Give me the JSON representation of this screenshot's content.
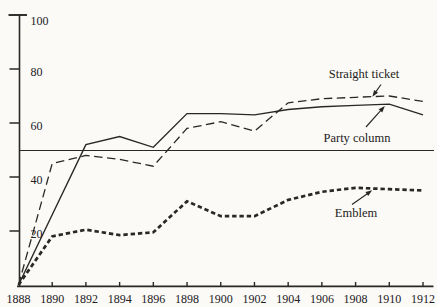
{
  "figure": {
    "background": "#fbfaf6",
    "ink": "#2a2825"
  },
  "chart_data": {
    "type": "line",
    "title": "",
    "xlabel": "",
    "ylabel": "",
    "x": [
      1888,
      1890,
      1892,
      1894,
      1896,
      1898,
      1900,
      1902,
      1904,
      1906,
      1908,
      1910,
      1912
    ],
    "x_tick_labels": [
      "1888",
      "1890",
      "1892",
      "1894",
      "1896",
      "1898",
      "1900",
      "1902",
      "1904",
      "1906",
      "1908",
      "1910",
      "1912"
    ],
    "ylim": [
      0,
      100
    ],
    "y_ticks": [
      20,
      40,
      60,
      80,
      100
    ],
    "grid": false,
    "legend": "inline-arrow-annotations",
    "reference_line": 50,
    "series": [
      {
        "name": "Straight ticket",
        "style": "long-dash",
        "dash": "8.5 4.5",
        "stroke_width": 1.3,
        "values": [
          0,
          45,
          48,
          46.5,
          44,
          58,
          60.5,
          57,
          67.5,
          69,
          69.5,
          70,
          68
        ]
      },
      {
        "name": "Party column",
        "style": "solid",
        "dash": null,
        "stroke_width": 1.4,
        "values": [
          0,
          26,
          52,
          55,
          51,
          63.5,
          63.5,
          63,
          65,
          66,
          66.5,
          67,
          63
        ]
      },
      {
        "name": "Emblem",
        "style": "short-dash-thick",
        "dash": "4.4 2.9",
        "stroke_width": 2.7,
        "values": [
          0,
          18,
          20.5,
          18.5,
          19.5,
          31,
          25.5,
          25.5,
          31.5,
          34.5,
          36,
          35.5,
          35
        ]
      }
    ],
    "annotations": [
      {
        "text": "Straight ticket",
        "tx": 364,
        "ty": 77.5,
        "arrow": [
          381,
          84.5,
          373.5,
          95
        ]
      },
      {
        "text": "Party column",
        "tx": 357,
        "ty": 141.5,
        "arrow": [
          366,
          127,
          383.5,
          107.5
        ]
      },
      {
        "text": "Emblem",
        "tx": 356,
        "ty": 217,
        "arrow": [
          352,
          204.5,
          370.5,
          191.5
        ]
      }
    ]
  }
}
